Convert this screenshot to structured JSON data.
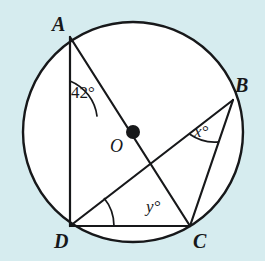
{
  "figure": {
    "name": "circle-geometry-diagram",
    "background_color": "#d6ecef",
    "stroke_color": "#17181a",
    "fill_color": "#ffffff",
    "circle": {
      "center": {
        "x": 133,
        "y": 132
      },
      "radius": 110,
      "center_dot_radius": 7
    },
    "points": {
      "A": {
        "x": 70,
        "y": 37
      },
      "B": {
        "x": 233,
        "y": 100
      },
      "C": {
        "x": 190,
        "y": 226
      },
      "D": {
        "x": 70,
        "y": 226
      },
      "O": {
        "x": 133,
        "y": 132
      }
    },
    "segments": [
      {
        "name": "chord-AD",
        "from": "A",
        "to": "D"
      },
      {
        "name": "diameter-AC",
        "from": "A",
        "to": "C"
      },
      {
        "name": "chord-DC",
        "from": "D",
        "to": "C"
      },
      {
        "name": "chord-DB",
        "from": "D",
        "to": "B"
      },
      {
        "name": "chord-BC",
        "from": "B",
        "to": "C"
      }
    ]
  },
  "labels": {
    "vertex_a": "A",
    "vertex_b": "B",
    "vertex_c": "C",
    "vertex_d": "D",
    "center_o": "O"
  },
  "angles": {
    "at_a": {
      "text": "42°",
      "value": 42,
      "vertex": "A",
      "between": [
        "AD",
        "AC"
      ],
      "arc_radius": 44
    },
    "at_b": {
      "text": "x°",
      "value": "x",
      "vertex": "B",
      "between": [
        "BD",
        "BC"
      ],
      "arc_radius": 44
    },
    "at_d": {
      "text": "y°",
      "value": "y",
      "vertex": "D",
      "between": [
        "DB",
        "DC"
      ],
      "arc_radius": 44
    }
  }
}
